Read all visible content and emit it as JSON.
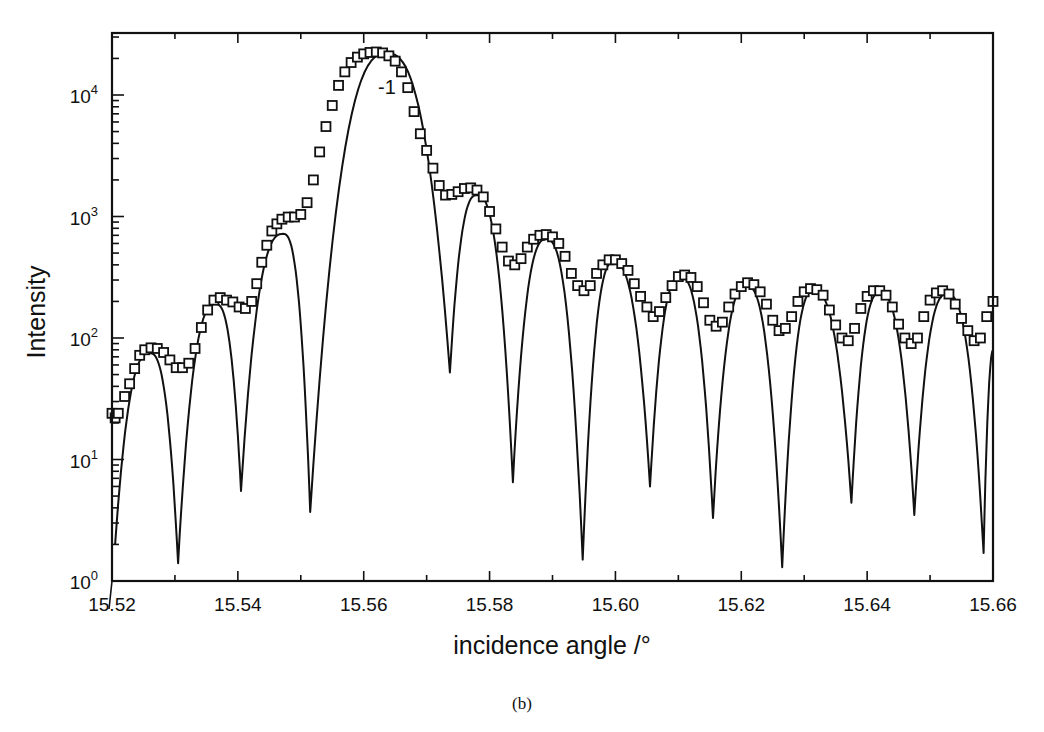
{
  "chart_data": {
    "type": "line",
    "title": "",
    "caption": "(b)",
    "xlabel": "incidence angle /°",
    "ylabel": "Intensity",
    "xlim": [
      15.52,
      15.66
    ],
    "ylim": [
      1,
      31623
    ],
    "yscale": "log",
    "grid": false,
    "legend": null,
    "x_ticks": [
      "15.52",
      "15.54",
      "15.56",
      "15.58",
      "15.60",
      "15.62",
      "15.64",
      "15.66"
    ],
    "y_ticks": [
      {
        "base": "10",
        "exp": "0",
        "value": 1
      },
      {
        "base": "10",
        "exp": "1",
        "value": 10
      },
      {
        "base": "10",
        "exp": "2",
        "value": 100
      },
      {
        "base": "10",
        "exp": "3",
        "value": 1000
      },
      {
        "base": "10",
        "exp": "4",
        "value": 10000
      }
    ],
    "annotations": [
      {
        "text": "-1",
        "x": 15.5637,
        "y": 11000
      }
    ],
    "series": [
      {
        "name": "calculated",
        "style": "solid-line",
        "peaks": [
          {
            "x": 15.526,
            "y": 75
          },
          {
            "x": 15.5365,
            "y": 190
          },
          {
            "x": 15.5472,
            "y": 720
          },
          {
            "x": 15.5637,
            "y": 22000
          },
          {
            "x": 15.578,
            "y": 1500
          },
          {
            "x": 15.589,
            "y": 650
          },
          {
            "x": 15.5997,
            "y": 420
          },
          {
            "x": 15.6103,
            "y": 320
          },
          {
            "x": 15.6208,
            "y": 270
          },
          {
            "x": 15.6315,
            "y": 245
          },
          {
            "x": 15.642,
            "y": 235
          },
          {
            "x": 15.6527,
            "y": 230
          }
        ],
        "minima": [
          {
            "x": 15.5205,
            "y": 2.0
          },
          {
            "x": 15.5305,
            "y": 1.4
          },
          {
            "x": 15.5405,
            "y": 5.5
          },
          {
            "x": 15.5515,
            "y": 3.7
          },
          {
            "x": 15.5737,
            "y": 52
          },
          {
            "x": 15.5837,
            "y": 6.5
          },
          {
            "x": 15.5948,
            "y": 1.5
          },
          {
            "x": 15.6055,
            "y": 6.0
          },
          {
            "x": 15.6155,
            "y": 3.3
          },
          {
            "x": 15.6265,
            "y": 1.3
          },
          {
            "x": 15.6375,
            "y": 4.4
          },
          {
            "x": 15.6475,
            "y": 3.5
          },
          {
            "x": 15.6585,
            "y": 1.7
          }
        ]
      },
      {
        "name": "measured",
        "style": "open-square-markers",
        "points": [
          [
            15.52,
            24
          ],
          [
            15.5205,
            22
          ],
          [
            15.521,
            24
          ],
          [
            15.522,
            33
          ],
          [
            15.5228,
            42
          ],
          [
            15.5236,
            56
          ],
          [
            15.5244,
            72
          ],
          [
            15.5252,
            80
          ],
          [
            15.5262,
            83
          ],
          [
            15.5272,
            82
          ],
          [
            15.5282,
            76
          ],
          [
            15.5292,
            66
          ],
          [
            15.5302,
            57
          ],
          [
            15.5312,
            57
          ],
          [
            15.5322,
            62
          ],
          [
            15.5332,
            82
          ],
          [
            15.5342,
            122
          ],
          [
            15.5352,
            170
          ],
          [
            15.5362,
            205
          ],
          [
            15.5372,
            215
          ],
          [
            15.5382,
            205
          ],
          [
            15.5392,
            198
          ],
          [
            15.5402,
            180
          ],
          [
            15.5412,
            175
          ],
          [
            15.5422,
            200
          ],
          [
            15.543,
            280
          ],
          [
            15.5438,
            420
          ],
          [
            15.5446,
            580
          ],
          [
            15.5454,
            760
          ],
          [
            15.5462,
            870
          ],
          [
            15.547,
            950
          ],
          [
            15.548,
            990
          ],
          [
            15.549,
            990
          ],
          [
            15.55,
            1040
          ],
          [
            15.551,
            1300
          ],
          [
            15.552,
            2000
          ],
          [
            15.553,
            3400
          ],
          [
            15.554,
            5500
          ],
          [
            15.555,
            8200
          ],
          [
            15.556,
            12000
          ],
          [
            15.557,
            15500
          ],
          [
            15.558,
            18500
          ],
          [
            15.559,
            20500
          ],
          [
            15.56,
            21800
          ],
          [
            15.561,
            22400
          ],
          [
            15.562,
            22600
          ],
          [
            15.563,
            22200
          ],
          [
            15.564,
            21000
          ],
          [
            15.565,
            19000
          ],
          [
            15.566,
            15500
          ],
          [
            15.567,
            11500
          ],
          [
            15.568,
            7300
          ],
          [
            15.569,
            4800
          ],
          [
            15.57,
            3500
          ],
          [
            15.571,
            2500
          ],
          [
            15.572,
            1800
          ],
          [
            15.573,
            1500
          ],
          [
            15.574,
            1520
          ],
          [
            15.575,
            1600
          ],
          [
            15.576,
            1700
          ],
          [
            15.577,
            1720
          ],
          [
            15.578,
            1650
          ],
          [
            15.579,
            1450
          ],
          [
            15.58,
            1100
          ],
          [
            15.581,
            790
          ],
          [
            15.582,
            560
          ],
          [
            15.583,
            430
          ],
          [
            15.584,
            400
          ],
          [
            15.585,
            450
          ],
          [
            15.586,
            560
          ],
          [
            15.587,
            650
          ],
          [
            15.588,
            700
          ],
          [
            15.589,
            710
          ],
          [
            15.59,
            680
          ],
          [
            15.591,
            600
          ],
          [
            15.592,
            470
          ],
          [
            15.593,
            340
          ],
          [
            15.594,
            270
          ],
          [
            15.595,
            245
          ],
          [
            15.596,
            270
          ],
          [
            15.597,
            340
          ],
          [
            15.598,
            400
          ],
          [
            15.599,
            440
          ],
          [
            15.6,
            440
          ],
          [
            15.601,
            410
          ],
          [
            15.602,
            360
          ],
          [
            15.603,
            280
          ],
          [
            15.604,
            220
          ],
          [
            15.605,
            180
          ],
          [
            15.606,
            150
          ],
          [
            15.607,
            165
          ],
          [
            15.608,
            215
          ],
          [
            15.609,
            270
          ],
          [
            15.61,
            320
          ],
          [
            15.611,
            330
          ],
          [
            15.612,
            315
          ],
          [
            15.613,
            265
          ],
          [
            15.614,
            195
          ],
          [
            15.615,
            140
          ],
          [
            15.616,
            125
          ],
          [
            15.617,
            135
          ],
          [
            15.618,
            180
          ],
          [
            15.619,
            230
          ],
          [
            15.62,
            265
          ],
          [
            15.621,
            285
          ],
          [
            15.622,
            275
          ],
          [
            15.623,
            240
          ],
          [
            15.624,
            190
          ],
          [
            15.625,
            140
          ],
          [
            15.626,
            115
          ],
          [
            15.627,
            120
          ],
          [
            15.628,
            150
          ],
          [
            15.629,
            200
          ],
          [
            15.63,
            240
          ],
          [
            15.631,
            255
          ],
          [
            15.632,
            250
          ],
          [
            15.633,
            225
          ],
          [
            15.634,
            170
          ],
          [
            15.635,
            128
          ],
          [
            15.636,
            100
          ],
          [
            15.637,
            95
          ],
          [
            15.638,
            120
          ],
          [
            15.639,
            175
          ],
          [
            15.64,
            220
          ],
          [
            15.641,
            245
          ],
          [
            15.642,
            245
          ],
          [
            15.643,
            225
          ],
          [
            15.644,
            180
          ],
          [
            15.645,
            130
          ],
          [
            15.646,
            100
          ],
          [
            15.647,
            90
          ],
          [
            15.648,
            100
          ],
          [
            15.649,
            150
          ],
          [
            15.65,
            205
          ],
          [
            15.651,
            235
          ],
          [
            15.652,
            245
          ],
          [
            15.653,
            230
          ],
          [
            15.654,
            190
          ],
          [
            15.655,
            145
          ],
          [
            15.656,
            115
          ],
          [
            15.657,
            95
          ],
          [
            15.658,
            100
          ],
          [
            15.659,
            150
          ],
          [
            15.66,
            200
          ]
        ]
      }
    ]
  },
  "labels": {
    "xlabel": "incidence angle /°",
    "ylabel": "Intensity",
    "annotation": "-1",
    "caption": "(b)"
  }
}
